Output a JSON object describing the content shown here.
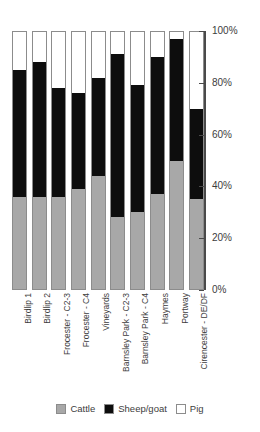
{
  "chart_data": {
    "type": "bar",
    "subtype": "stacked-percentage-column",
    "title": "",
    "subtitle": "",
    "xlabel": "",
    "ylabel": "",
    "ylim": [
      0,
      100
    ],
    "yticks": [
      0,
      20,
      40,
      60,
      80,
      100
    ],
    "ytick_labels": [
      "0%",
      "20%",
      "40%",
      "60%",
      "80%",
      "100%"
    ],
    "grid": false,
    "legend_position": "bottom",
    "units": "percent",
    "categories": [
      "Birdlip 1",
      "Birdlip 2",
      "Frocester - C2-3",
      "Frocester - C4",
      "Vineyards",
      "Barnsley Park - C2-3",
      "Barnsley Park - C4",
      "Haymes",
      "Portway",
      "Cirencester - DE/DF"
    ],
    "series": [
      {
        "name": "Cattle",
        "color": "#a8a8a8",
        "values": [
          36,
          36,
          36,
          39,
          44,
          28,
          30,
          37,
          50,
          35
        ]
      },
      {
        "name": "Sheep/goat",
        "color": "#0d0d0d",
        "values": [
          49,
          52,
          42,
          37,
          38,
          63,
          49,
          53,
          47,
          35
        ]
      },
      {
        "name": "Pig",
        "color": "#ffffff",
        "values": [
          15,
          12,
          22,
          24,
          18,
          9,
          21,
          10,
          3,
          30
        ]
      }
    ]
  },
  "legend": {
    "items": [
      {
        "label": "Cattle",
        "swatch": "cattle-swatch"
      },
      {
        "label": "Sheep/goat",
        "swatch": "sheep-goat-swatch"
      },
      {
        "label": "Pig",
        "swatch": "pig-swatch"
      }
    ]
  },
  "colors": {
    "cattle": "#a8a8a8",
    "sheepgoat": "#0d0d0d",
    "pig": "#ffffff",
    "outline": "#8c8c8c",
    "axis": "#4a4a4a",
    "text": "#3c3c3c",
    "background": "#ffffff"
  }
}
